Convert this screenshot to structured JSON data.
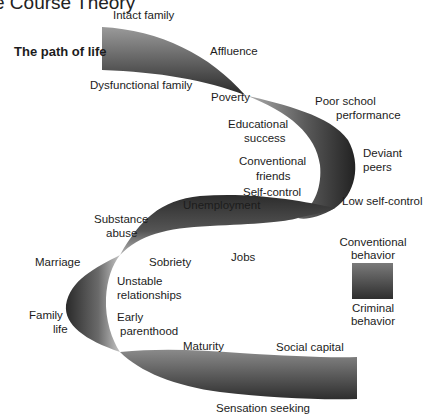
{
  "title": "e Course Theory",
  "heading": "The path of life",
  "colors": {
    "ribbon_light": "#8a8a8a",
    "ribbon_dark": "#2e2e2e",
    "text": "#1c1c1c",
    "background": "#ffffff"
  },
  "labels": {
    "intact_family": "Intact family",
    "dysfunctional_family": "Dysfunctional family",
    "affluence": "Affluence",
    "poverty": "Poverty",
    "poor_school_1": "Poor school",
    "poor_school_2": "performance",
    "educational_1": "Educational",
    "educational_2": "success",
    "conventional_friends_1": "Conventional",
    "conventional_friends_2": "friends",
    "deviant_1": "Deviant",
    "deviant_2": "peers",
    "self_control": "Self-control",
    "low_self_control": "Low self-control",
    "unemployment": "Unemployment",
    "substance_1": "Substance",
    "substance_2": "abuse",
    "marriage": "Marriage",
    "sobriety": "Sobriety",
    "jobs": "Jobs",
    "unstable_1": "Unstable",
    "unstable_2": "relationships",
    "family_life_1": "Family",
    "family_life_2": "life",
    "early_1": "Early",
    "early_2": "parenthood",
    "maturity": "Maturity",
    "social_capital": "Social capital",
    "sensation_seeking": "Sensation seeking"
  },
  "legend": {
    "top_1": "Conventional",
    "top_2": "behavior",
    "bottom_1": "Criminal",
    "bottom_2": "behavior"
  }
}
